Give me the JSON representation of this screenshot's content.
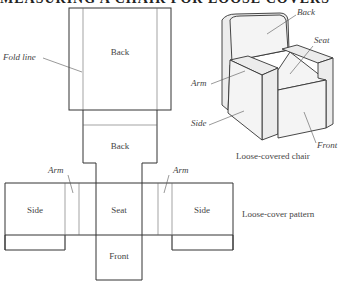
{
  "title": "MEASURING A CHAIR FOR LOOSE COVERS",
  "pattern": {
    "caption": "Loose-cover pattern",
    "panels": {
      "back_top": "Back",
      "back_inner": "Back",
      "seat": "Seat",
      "side_left": "Side",
      "side_right": "Side",
      "front": "Front"
    },
    "callouts": {
      "fold_line": "Fold line",
      "arm_left": "Arm",
      "arm_right": "Arm"
    }
  },
  "chair": {
    "caption": "Loose-covered chair",
    "callouts": {
      "back": "Back",
      "seat": "Seat",
      "arm": "Arm",
      "side": "Side",
      "front": "Front"
    }
  }
}
